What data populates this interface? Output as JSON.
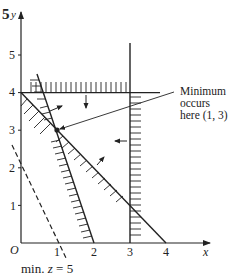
{
  "diagram": {
    "type": "linear-programming-feasible-region",
    "axes": {
      "x_label": "x",
      "y_label": "y",
      "origin_label": "O",
      "x_ticks": [
        "1",
        "2",
        "3",
        "4"
      ],
      "y_ticks": [
        "1",
        "2",
        "3",
        "4",
        "5"
      ],
      "y_top_label": "5"
    },
    "constraints": [
      {
        "name": "3x + y = 6",
        "through": [
          [
            0.5,
            4.5
          ],
          [
            2,
            0
          ]
        ],
        "shaded_side": "below-left"
      },
      {
        "name": "x + y = 4",
        "through": [
          [
            0,
            4
          ],
          [
            4,
            0
          ]
        ],
        "shaded_side": "below-left"
      },
      {
        "name": "y = 4",
        "through": [
          [
            0,
            4
          ],
          [
            3.8,
            4
          ]
        ],
        "shaded_side": "above"
      },
      {
        "name": "x = 3",
        "through": [
          [
            3,
            0
          ],
          [
            3,
            5.3
          ]
        ],
        "shaded_side": "right"
      }
    ],
    "objective_line": {
      "name": "2x + y = 2",
      "style": "dashed"
    },
    "annotation": {
      "line1": "Minimum",
      "line2": "occurs",
      "line3": "here (1, 3)",
      "point": [
        1,
        3
      ]
    },
    "caption": {
      "prefix": "min. ",
      "var": "z",
      "suffix": " = 5"
    }
  }
}
